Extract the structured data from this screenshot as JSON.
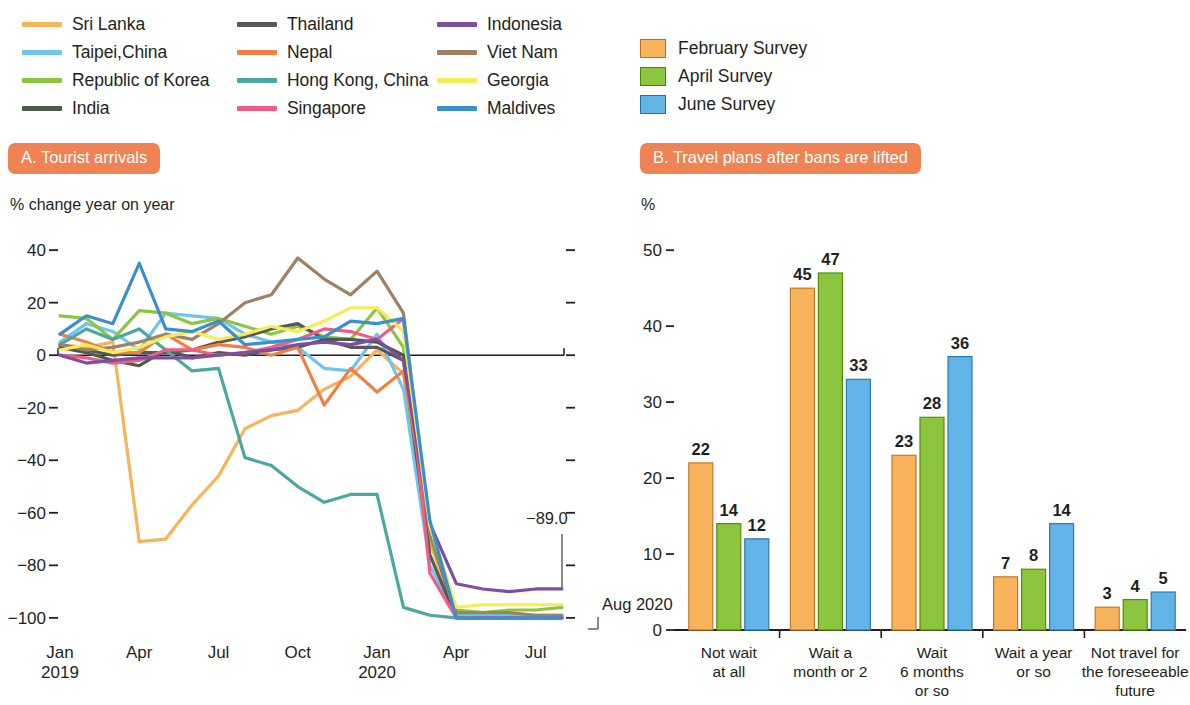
{
  "line_legend": {
    "items": [
      {
        "label": "Sri Lanka",
        "color": "#f9b35c"
      },
      {
        "label": "Thailand",
        "color": "#57585a"
      },
      {
        "label": "Indonesia",
        "color": "#7d4f9e"
      },
      {
        "label": "Taipei,China",
        "color": "#6fc5ee"
      },
      {
        "label": "Nepal",
        "color": "#f07f43"
      },
      {
        "label": "Viet Nam",
        "color": "#a08162"
      },
      {
        "label": "Republic of Korea",
        "color": "#8cc63f"
      },
      {
        "label": "Hong Kong, China",
        "color": "#4aa8a3"
      },
      {
        "label": "Georgia",
        "color": "#f6ec57"
      },
      {
        "label": "India",
        "color": "#4a5b47"
      },
      {
        "label": "Singapore",
        "color": "#ee5d8a"
      },
      {
        "label": "Maldives",
        "color": "#3a8fd0"
      }
    ]
  },
  "bar_legend": {
    "items": [
      {
        "label": "February Survey",
        "color": "#f9b35c"
      },
      {
        "label": "April Survey",
        "color": "#8cc63f"
      },
      {
        "label": "June Survey",
        "color": "#62b4e8"
      }
    ]
  },
  "panelA": {
    "title": "A. Tourist arrivals",
    "unit": "% change year on year",
    "annotation_value": "−89.0",
    "annotation_date": "Aug 2020"
  },
  "panelB": {
    "title": "B. Travel plans after bans are lifted",
    "unit": "%"
  },
  "theme": {
    "badge": "#ef8354",
    "axis": "#231f20"
  },
  "chart_data": [
    {
      "type": "line",
      "title": "A. Tourist arrivals",
      "xlabel": "",
      "ylabel": "% change year on year",
      "ylim": [
        -105,
        45
      ],
      "yticks": [
        40,
        20,
        0,
        -20,
        -40,
        -60,
        -80,
        -100
      ],
      "ytick_labels": [
        "40",
        "20",
        "0",
        "−20",
        "−40",
        "−60",
        "−80",
        "−100"
      ],
      "grid": false,
      "legend_position": "above",
      "x": [
        "2019-01",
        "2019-02",
        "2019-03",
        "2019-04",
        "2019-05",
        "2019-06",
        "2019-07",
        "2019-08",
        "2019-09",
        "2019-10",
        "2019-11",
        "2019-12",
        "2020-01",
        "2020-02",
        "2020-03",
        "2020-04",
        "2020-05",
        "2020-06",
        "2020-07",
        "2020-08"
      ],
      "xticks": [
        "2019-01",
        "2019-04",
        "2019-07",
        "2019-10",
        "2020-01",
        "2020-04",
        "2020-07"
      ],
      "xtick_labels": [
        "Jan\n2019",
        "Apr",
        "Jul",
        "Oct",
        "Jan\n2020",
        "Apr",
        "Jul"
      ],
      "annotations": [
        {
          "text": "−89.0",
          "series": "Indonesia",
          "at": "2020-08"
        },
        {
          "text": "Aug 2020",
          "at": "2020-08"
        }
      ],
      "series": [
        {
          "name": "Sri Lanka",
          "color": "#f9b35c",
          "values": [
            4,
            3,
            5,
            -71,
            -70,
            -57,
            -46,
            -28,
            -23,
            -21,
            -13,
            -8,
            2,
            -7,
            -71,
            -100,
            -100,
            -100,
            -100,
            -100
          ]
        },
        {
          "name": "Taipei,China",
          "color": "#6fc5ee",
          "values": [
            5,
            12,
            9,
            2,
            16,
            15,
            14,
            8,
            5,
            3,
            -5,
            -6,
            8,
            -13,
            -80,
            -99,
            -99,
            -99,
            -99,
            -99
          ]
        },
        {
          "name": "Republic of Korea",
          "color": "#8cc63f",
          "values": [
            15,
            14,
            6,
            17,
            16,
            12,
            14,
            11,
            8,
            11,
            7,
            6,
            18,
            3,
            -70,
            -97,
            -98,
            -97,
            -97,
            -96
          ]
        },
        {
          "name": "India",
          "color": "#4a5b47",
          "values": [
            3,
            1,
            -2,
            -4,
            2,
            -1,
            1,
            0,
            2,
            3,
            6,
            6,
            5,
            0,
            -67,
            -100,
            -100,
            -100,
            -100,
            -100
          ]
        },
        {
          "name": "Thailand",
          "color": "#57585a",
          "values": [
            4,
            2,
            0,
            1,
            1,
            2,
            5,
            7,
            10,
            12,
            6,
            3,
            3,
            -2,
            -76,
            -100,
            -100,
            -100,
            -100,
            -100
          ]
        },
        {
          "name": "Nepal",
          "color": "#f07f43",
          "values": [
            8,
            5,
            1,
            1,
            8,
            2,
            4,
            3,
            0,
            3,
            -19,
            -5,
            -14,
            -6,
            -65,
            -100,
            -100,
            -100,
            -100,
            -100
          ]
        },
        {
          "name": "Hong Kong, China",
          "color": "#4aa8a3",
          "values": [
            4,
            10,
            6,
            10,
            2,
            -6,
            -5,
            -39,
            -42,
            -50,
            -56,
            -53,
            -53,
            -96,
            -99,
            -100,
            -100,
            -100,
            -100,
            -100
          ]
        },
        {
          "name": "Singapore",
          "color": "#ee5d8a",
          "values": [
            0,
            -1,
            -3,
            -2,
            2,
            2,
            0,
            1,
            3,
            6,
            10,
            9,
            6,
            14,
            -83,
            -100,
            -100,
            -100,
            -100,
            -100
          ]
        },
        {
          "name": "Indonesia",
          "color": "#7d4f9e",
          "values": [
            0,
            -3,
            -2,
            -1,
            -1,
            -1,
            0,
            1,
            2,
            4,
            5,
            4,
            6,
            -2,
            -64,
            -87,
            -89,
            -90,
            -89,
            -89
          ]
        },
        {
          "name": "Viet Nam",
          "color": "#a08162",
          "values": [
            4,
            2,
            3,
            5,
            8,
            6,
            12,
            20,
            23,
            37,
            29,
            23,
            32,
            16,
            -68,
            -98,
            -98,
            -98,
            -99,
            -99
          ]
        },
        {
          "name": "Georgia",
          "color": "#f6ec57",
          "values": [
            2,
            4,
            1,
            3,
            7,
            9,
            6,
            8,
            11,
            9,
            13,
            18,
            18,
            9,
            -65,
            -96,
            -95,
            -95,
            -95,
            -95
          ]
        },
        {
          "name": "Maldives",
          "color": "#3a8fd0",
          "values": [
            8,
            15,
            12,
            35,
            10,
            9,
            13,
            4,
            5,
            6,
            7,
            13,
            12,
            14,
            -63,
            -100,
            -100,
            -100,
            -100,
            -100
          ]
        }
      ]
    },
    {
      "type": "bar",
      "title": "B. Travel plans after bans are lifted",
      "xlabel": "",
      "ylabel": "%",
      "ylim": [
        0,
        52
      ],
      "yticks": [
        0,
        10,
        20,
        30,
        40,
        50
      ],
      "ytick_labels": [
        "0",
        "10",
        "20",
        "30",
        "40",
        "50"
      ],
      "grid": false,
      "legend_position": "above",
      "categories": [
        "Not wait\nat all",
        "Wait a\nmonth or 2",
        "Wait\n6 months\nor so",
        "Wait a year\nor so",
        "Not travel for\nthe foreseeable\nfuture"
      ],
      "series": [
        {
          "name": "February Survey",
          "color": "#f9b35c",
          "values": [
            22,
            45,
            23,
            7,
            3
          ]
        },
        {
          "name": "April Survey",
          "color": "#8cc63f",
          "values": [
            14,
            47,
            28,
            8,
            4
          ]
        },
        {
          "name": "June Survey",
          "color": "#62b4e8",
          "values": [
            12,
            33,
            36,
            14,
            5
          ]
        }
      ]
    }
  ]
}
